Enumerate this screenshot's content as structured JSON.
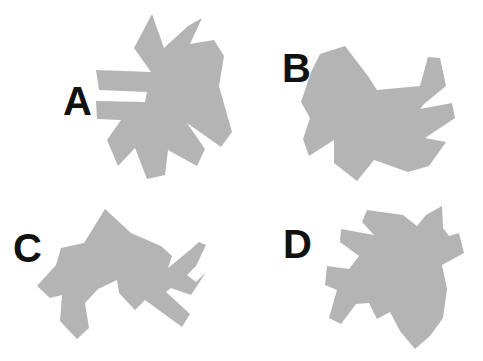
{
  "page": {
    "background_color": "#ffffff",
    "width": 483,
    "height": 361
  },
  "style": {
    "shape_fill": "#b4b4b4",
    "label_color": "#111111",
    "label_font_size_px": 40
  },
  "items": [
    {
      "id": "a",
      "label": "A",
      "label_position": {
        "x": 63,
        "y": 81
      },
      "shape_name": "abstract-polygon-a",
      "rotation_hint": "upper-left, arrow-head pointing up-right",
      "points": "152,14 164,48 188,26 202,18 190,44 214,40 224,56 219,86 232,132 221,147 187,123 205,149 197,166 168,150 165,175 147,179 135,148 118,166 107,140 121,120 97,119 96,101 145,102 147,92 99,90 96,70 151,72 134,48"
    },
    {
      "id": "b",
      "label": "B",
      "label_position": {
        "x": 282,
        "y": 48
      },
      "shape_name": "abstract-polygon-b",
      "rotation_hint": "upper-right, arrow-head pointing left",
      "points": "345,46 368,76 377,90 420,86 428,57 440,58 446,86 424,104 420,109 452,103 455,118 425,138 446,142 429,166 408,172 374,160 357,181 334,163 334,140 309,156 303,139 310,118 301,102 311,72 320,54"
    },
    {
      "id": "c",
      "label": "C",
      "label_position": {
        "x": 13,
        "y": 228
      },
      "shape_name": "abstract-polygon-c",
      "rotation_hint": "lower-left, arrow-head pointing left-down",
      "points": "105,209 131,233 161,246 172,256 168,268 190,250 199,242 206,245 196,266 187,275 196,282 206,272 191,295 171,288 166,292 190,314 182,327 145,300 135,310 119,293 117,280 98,289 85,303 89,328 77,339 60,321 62,295 50,298 37,286 56,265 61,248 84,243"
    },
    {
      "id": "d",
      "label": "D",
      "label_position": {
        "x": 283,
        "y": 224
      },
      "shape_name": "abstract-polygon-d",
      "rotation_hint": "lower-right, arrow-head pointing right-down",
      "points": "367,210 403,215 417,226 426,215 442,206 443,228 449,236 459,233 464,253 442,265 447,289 443,318 430,336 415,349 400,331 390,312 377,319 369,303 356,304 341,324 329,318 337,290 325,285 327,266 349,269 359,256 340,242 341,229 374,235 362,222"
    }
  ]
}
